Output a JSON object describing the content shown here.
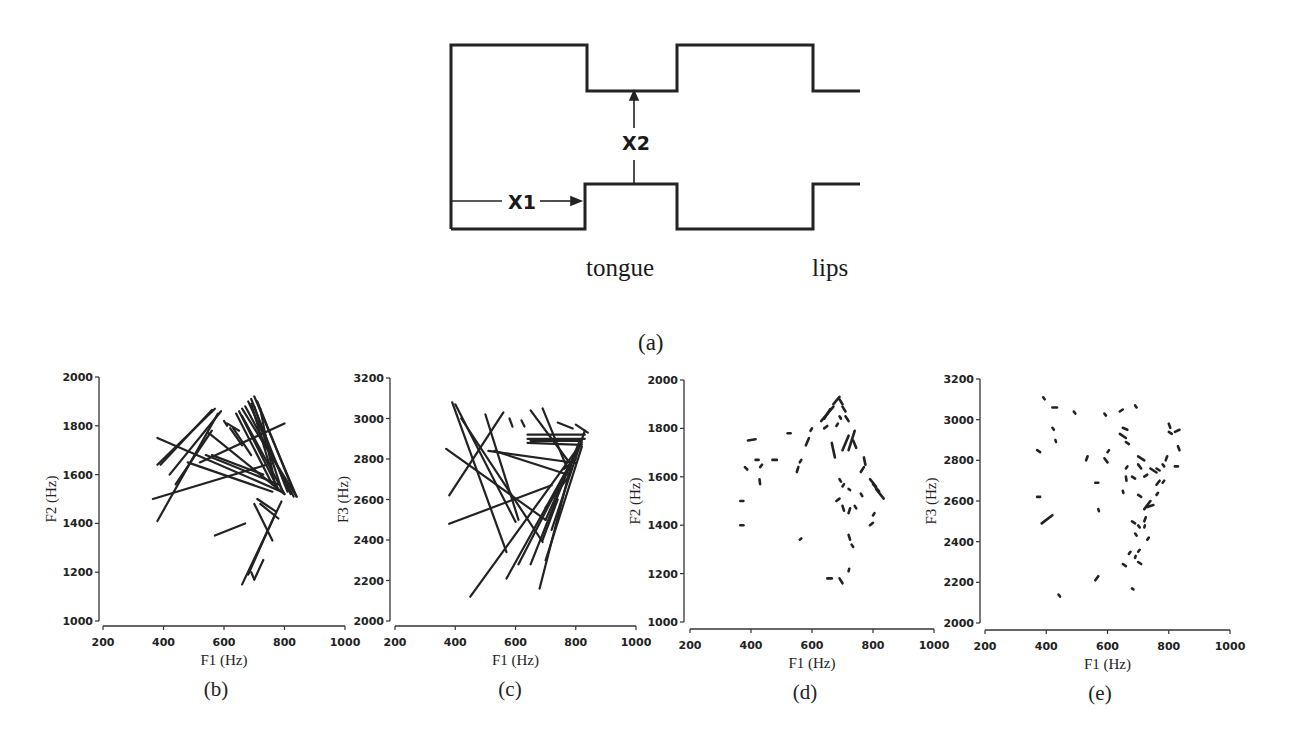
{
  "figure": {
    "tube_diagram": {
      "label_x1": "X1",
      "label_x2": "X2",
      "label_tongue": "tongue",
      "label_lips": "lips",
      "caption": "(a)"
    }
  },
  "chart_data": [
    {
      "id": "b",
      "type": "line",
      "panel_label": "(b)",
      "title": "",
      "xlabel": "F1 (Hz)",
      "ylabel": "F2 (Hz)",
      "xlim": [
        200,
        1000
      ],
      "ylim": [
        1000,
        2000
      ],
      "xticks": [
        200,
        400,
        600,
        800,
        1000
      ],
      "yticks": [
        1000,
        1200,
        1400,
        1600,
        1800,
        2000
      ],
      "grid": false,
      "description": "Formant trajectories drawn as line segments (long arrows)",
      "segments": [
        [
          380,
          1640,
          570,
          1870
        ],
        [
          390,
          1640,
          560,
          1865
        ],
        [
          420,
          1600,
          590,
          1860
        ],
        [
          380,
          1410,
          580,
          1850
        ],
        [
          440,
          1560,
          560,
          1780
        ],
        [
          380,
          1750,
          790,
          1530
        ],
        [
          365,
          1500,
          740,
          1640
        ],
        [
          480,
          1650,
          760,
          1530
        ],
        [
          550,
          1770,
          800,
          1520
        ],
        [
          540,
          1680,
          780,
          1560
        ],
        [
          560,
          1680,
          730,
          1600
        ],
        [
          520,
          1650,
          800,
          1810
        ],
        [
          660,
          1870,
          840,
          1510
        ],
        [
          670,
          1880,
          830,
          1510
        ],
        [
          680,
          1900,
          820,
          1520
        ],
        [
          690,
          1910,
          810,
          1530
        ],
        [
          700,
          1920,
          840,
          1510
        ],
        [
          650,
          1860,
          780,
          1540
        ],
        [
          640,
          1850,
          760,
          1560
        ],
        [
          660,
          1840,
          800,
          1520
        ],
        [
          690,
          1890,
          760,
          1600
        ],
        [
          700,
          1880,
          790,
          1540
        ],
        [
          710,
          1900,
          830,
          1530
        ],
        [
          720,
          1870,
          770,
          1550
        ],
        [
          620,
          1790,
          660,
          1720
        ],
        [
          610,
          1810,
          650,
          1780
        ],
        [
          630,
          1790,
          690,
          1680
        ],
        [
          660,
          1150,
          790,
          1490
        ],
        [
          680,
          1190,
          770,
          1440
        ],
        [
          700,
          1170,
          730,
          1250
        ],
        [
          570,
          1350,
          670,
          1400
        ],
        [
          700,
          1480,
          760,
          1330
        ],
        [
          710,
          1500,
          770,
          1450
        ],
        [
          720,
          1480,
          780,
          1420
        ],
        [
          600,
          1820,
          610,
          1800
        ],
        [
          690,
          1200,
          700,
          1170
        ]
      ]
    },
    {
      "id": "c",
      "type": "line",
      "panel_label": "(c)",
      "title": "",
      "xlabel": "F1 (Hz)",
      "ylabel": "F3 (Hz)",
      "xlim": [
        200,
        1000
      ],
      "ylim": [
        2000,
        3200
      ],
      "xticks": [
        200,
        400,
        600,
        800,
        1000
      ],
      "yticks": [
        2000,
        2200,
        2400,
        2600,
        2800,
        3000,
        3200
      ],
      "grid": false,
      "description": "Formant trajectories drawn as line segments (long arrows)",
      "segments": [
        [
          390,
          3080,
          570,
          2340
        ],
        [
          400,
          3070,
          600,
          2490
        ],
        [
          420,
          3000,
          690,
          2390
        ],
        [
          500,
          3020,
          610,
          2500
        ],
        [
          380,
          2620,
          560,
          3030
        ],
        [
          370,
          2850,
          700,
          2500
        ],
        [
          380,
          2480,
          720,
          2670
        ],
        [
          510,
          2840,
          800,
          2780
        ],
        [
          530,
          2840,
          780,
          2720
        ],
        [
          450,
          2120,
          800,
          2840
        ],
        [
          570,
          2210,
          820,
          2880
        ],
        [
          640,
          2900,
          830,
          2900
        ],
        [
          640,
          2920,
          830,
          2920
        ],
        [
          650,
          2890,
          820,
          2890
        ],
        [
          640,
          2880,
          820,
          2870
        ],
        [
          650,
          3040,
          780,
          2780
        ],
        [
          690,
          3050,
          770,
          2760
        ],
        [
          680,
          2160,
          790,
          2800
        ],
        [
          700,
          2300,
          820,
          2860
        ],
        [
          720,
          2450,
          830,
          2940
        ],
        [
          650,
          2280,
          810,
          2880
        ],
        [
          610,
          2280,
          800,
          2830
        ],
        [
          700,
          2560,
          780,
          2720
        ],
        [
          580,
          3000,
          590,
          2960
        ],
        [
          620,
          2990,
          630,
          2960
        ],
        [
          740,
          2980,
          790,
          2950
        ],
        [
          800,
          2970,
          840,
          2930
        ],
        [
          760,
          2750,
          800,
          2800
        ],
        [
          700,
          2500,
          760,
          2700
        ],
        [
          690,
          2400,
          740,
          2600
        ]
      ]
    },
    {
      "id": "d",
      "type": "scatter",
      "panel_label": "(d)",
      "title": "",
      "xlabel": "F1 (Hz)",
      "ylabel": "F2 (Hz)",
      "xlim": [
        200,
        1000
      ],
      "ylim": [
        1000,
        2000
      ],
      "xticks": [
        200,
        400,
        600,
        800,
        1000
      ],
      "yticks": [
        1000,
        1200,
        1400,
        1600,
        1800,
        2000
      ],
      "grid": false,
      "description": "Short formant trajectory segments (dashes)",
      "segments": [
        [
          390,
          1750,
          415,
          1755
        ],
        [
          380,
          1640,
          388,
          1630
        ],
        [
          415,
          1670,
          425,
          1670
        ],
        [
          430,
          1640,
          436,
          1650
        ],
        [
          470,
          1670,
          485,
          1670
        ],
        [
          365,
          1500,
          375,
          1500
        ],
        [
          365,
          1400,
          375,
          1400
        ],
        [
          428,
          1590,
          430,
          1570
        ],
        [
          520,
          1780,
          530,
          1780
        ],
        [
          550,
          1620,
          555,
          1640
        ],
        [
          560,
          1660,
          565,
          1670
        ],
        [
          580,
          1730,
          590,
          1760
        ],
        [
          595,
          1790,
          600,
          1800
        ],
        [
          560,
          1340,
          565,
          1345
        ],
        [
          630,
          1830,
          650,
          1860
        ],
        [
          640,
          1840,
          660,
          1880
        ],
        [
          650,
          1860,
          670,
          1890
        ],
        [
          670,
          1900,
          690,
          1930
        ],
        [
          690,
          1920,
          700,
          1900
        ],
        [
          700,
          1890,
          710,
          1870
        ],
        [
          710,
          1850,
          720,
          1830
        ],
        [
          675,
          1680,
          665,
          1740
        ],
        [
          700,
          1710,
          720,
          1770
        ],
        [
          720,
          1710,
          740,
          1790
        ],
        [
          735,
          1750,
          745,
          1720
        ],
        [
          770,
          1680,
          775,
          1650
        ],
        [
          760,
          1620,
          770,
          1640
        ],
        [
          640,
          1800,
          650,
          1810
        ],
        [
          680,
          1810,
          685,
          1820
        ],
        [
          690,
          1590,
          695,
          1580
        ],
        [
          700,
          1560,
          705,
          1570
        ],
        [
          720,
          1550,
          725,
          1545
        ],
        [
          760,
          1530,
          765,
          1520
        ],
        [
          790,
          1590,
          810,
          1560
        ],
        [
          800,
          1570,
          820,
          1540
        ],
        [
          810,
          1550,
          835,
          1510
        ],
        [
          680,
          1500,
          690,
          1510
        ],
        [
          700,
          1480,
          705,
          1460
        ],
        [
          720,
          1450,
          725,
          1470
        ],
        [
          740,
          1480,
          745,
          1470
        ],
        [
          790,
          1400,
          800,
          1410
        ],
        [
          800,
          1440,
          805,
          1450
        ],
        [
          720,
          1360,
          725,
          1340
        ],
        [
          730,
          1320,
          735,
          1310
        ],
        [
          650,
          1180,
          665,
          1180
        ],
        [
          690,
          1180,
          700,
          1160
        ],
        [
          720,
          1210,
          722,
          1220
        ],
        [
          690,
          1850,
          695,
          1840
        ]
      ]
    },
    {
      "id": "e",
      "type": "scatter",
      "panel_label": "(e)",
      "title": "",
      "xlabel": "F1 (Hz)",
      "ylabel": "F3 (Hz)",
      "xlim": [
        200,
        1000
      ],
      "ylim": [
        2000,
        3200
      ],
      "xticks": [
        200,
        400,
        600,
        800,
        1000
      ],
      "yticks": [
        2000,
        2200,
        2400,
        2600,
        2800,
        3000,
        3200
      ],
      "grid": false,
      "description": "Short formant trajectory segments (dashes)",
      "segments": [
        [
          390,
          3110,
          395,
          3100
        ],
        [
          420,
          3060,
          435,
          3060
        ],
        [
          420,
          2960,
          425,
          2950
        ],
        [
          430,
          2900,
          432,
          2890
        ],
        [
          490,
          3040,
          495,
          3030
        ],
        [
          370,
          2850,
          380,
          2840
        ],
        [
          370,
          2620,
          380,
          2620
        ],
        [
          385,
          2490,
          420,
          2530
        ],
        [
          440,
          2140,
          445,
          2130
        ],
        [
          530,
          2800,
          535,
          2820
        ],
        [
          560,
          2690,
          570,
          2690
        ],
        [
          570,
          2560,
          572,
          2550
        ],
        [
          560,
          2210,
          570,
          2230
        ],
        [
          590,
          3030,
          595,
          3020
        ],
        [
          600,
          2840,
          605,
          2850
        ],
        [
          590,
          2810,
          600,
          2790
        ],
        [
          640,
          3040,
          650,
          3050
        ],
        [
          690,
          3070,
          695,
          3060
        ],
        [
          640,
          2930,
          660,
          2910
        ],
        [
          650,
          2960,
          665,
          2950
        ],
        [
          660,
          2890,
          670,
          2880
        ],
        [
          700,
          2820,
          720,
          2800
        ],
        [
          700,
          2780,
          710,
          2760
        ],
        [
          680,
          2720,
          690,
          2710
        ],
        [
          660,
          2720,
          662,
          2700
        ],
        [
          650,
          2650,
          652,
          2640
        ],
        [
          660,
          2760,
          665,
          2770
        ],
        [
          740,
          2760,
          760,
          2740
        ],
        [
          760,
          2760,
          770,
          2750
        ],
        [
          720,
          2720,
          730,
          2730
        ],
        [
          760,
          2680,
          770,
          2700
        ],
        [
          780,
          2690,
          785,
          2700
        ],
        [
          800,
          2980,
          805,
          2960
        ],
        [
          800,
          2940,
          810,
          2930
        ],
        [
          820,
          2940,
          835,
          2950
        ],
        [
          830,
          2870,
          835,
          2850
        ],
        [
          820,
          2770,
          830,
          2770
        ],
        [
          790,
          2800,
          795,
          2820
        ],
        [
          780,
          2780,
          785,
          2770
        ],
        [
          700,
          2630,
          710,
          2620
        ],
        [
          720,
          2560,
          740,
          2600
        ],
        [
          730,
          2570,
          750,
          2580
        ],
        [
          760,
          2630,
          765,
          2640
        ],
        [
          680,
          2500,
          690,
          2490
        ],
        [
          700,
          2480,
          705,
          2470
        ],
        [
          720,
          2470,
          722,
          2480
        ],
        [
          730,
          2410,
          735,
          2420
        ],
        [
          690,
          2440,
          695,
          2430
        ],
        [
          700,
          2350,
          705,
          2360
        ],
        [
          700,
          2300,
          710,
          2290
        ],
        [
          690,
          2320,
          692,
          2330
        ],
        [
          650,
          2290,
          660,
          2280
        ],
        [
          670,
          2340,
          675,
          2350
        ],
        [
          680,
          2170,
          685,
          2165
        ],
        [
          720,
          2500,
          725,
          2520
        ]
      ]
    }
  ]
}
